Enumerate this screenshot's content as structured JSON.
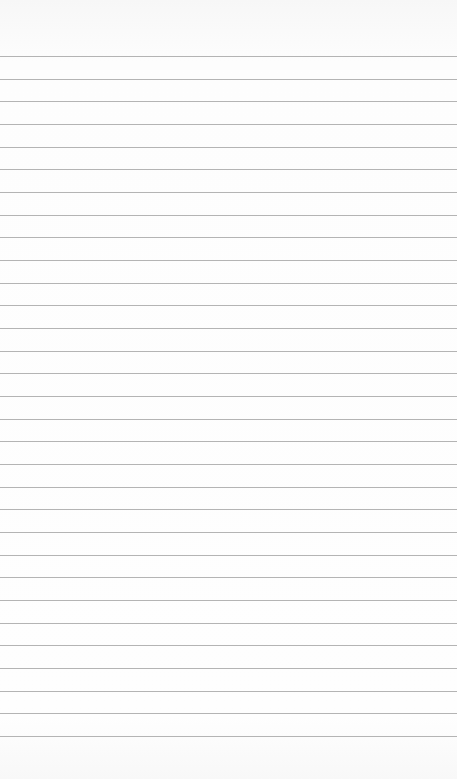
{
  "paper": {
    "type": "lined-paper",
    "background_color": "#fcfcfc",
    "line_color": "#b4b4b4",
    "line_count": 31,
    "first_line_y": 56,
    "line_spacing": 22.67
  }
}
